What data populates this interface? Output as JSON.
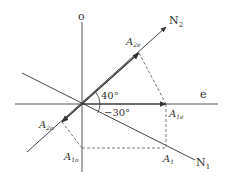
{
  "diagram": {
    "axes": {
      "vertical_label": "o",
      "horizontal_label": "e"
    },
    "lines": {
      "n2": {
        "label": "N",
        "subscript": "2"
      },
      "n1": {
        "label": "N",
        "subscript": "1"
      }
    },
    "angles": {
      "upper": "40°",
      "lower": "−30°"
    },
    "points": {
      "a2e": {
        "label": "A",
        "subscript": "2e"
      },
      "a2o": {
        "label": "A",
        "subscript": "2o"
      },
      "a1e": {
        "label": "A",
        "subscript": "1e"
      },
      "a1o": {
        "label": "A",
        "subscript": "1o"
      },
      "a1": {
        "label": "A",
        "subscript": "1"
      }
    },
    "colors": {
      "line": "#444444",
      "dashed": "#666666",
      "text": "#333333"
    }
  }
}
